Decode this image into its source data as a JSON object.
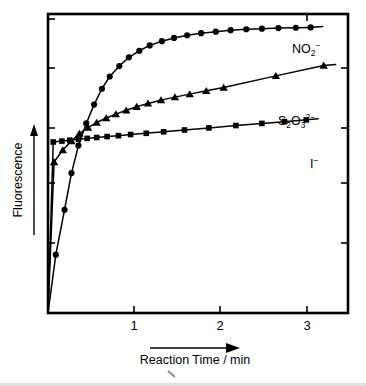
{
  "chart_data": {
    "type": "line",
    "title": "",
    "subtitle": "",
    "xlabel": "Reaction Time / min",
    "ylabel": "Fluorescence",
    "xlim": [
      0,
      3.45
    ],
    "ylim": [
      0,
      1.0
    ],
    "x_ticks": [
      1,
      2,
      3
    ],
    "x_tick_labels": [
      "1",
      "2",
      "3"
    ],
    "y_ticks": [],
    "y_tick_labels": [],
    "y_axis_unlabeled": true,
    "grid": false,
    "legend_position": "inline-right-of-curve",
    "frame": "box-with-inward-ticks",
    "series": [
      {
        "name": "NO2-",
        "label_text": "NO",
        "label_sub": "2",
        "label_sup": "−",
        "marker": "circle",
        "color": "#000000",
        "x": [
          0.0,
          0.09,
          0.19,
          0.27,
          0.35,
          0.44,
          0.53,
          0.62,
          0.71,
          0.82,
          0.93,
          1.05,
          1.17,
          1.31,
          1.45,
          1.6,
          1.76,
          1.93,
          2.1,
          2.28,
          2.46,
          2.65,
          2.85,
          3.02
        ],
        "y": [
          0.0,
          0.195,
          0.345,
          0.468,
          0.56,
          0.634,
          0.697,
          0.75,
          0.791,
          0.826,
          0.855,
          0.877,
          0.895,
          0.909,
          0.92,
          0.929,
          0.936,
          0.941,
          0.946,
          0.949,
          0.951,
          0.953,
          0.954,
          0.955
        ]
      },
      {
        "name": "S2O3 2-",
        "label_text": "S",
        "label_sub1": "2",
        "label_text2": "O",
        "label_sub2": "3",
        "label_sup": "2−",
        "marker": "triangle",
        "color": "#000000",
        "x": [
          0.0,
          0.07,
          0.17,
          0.27,
          0.36,
          0.46,
          0.56,
          0.67,
          0.78,
          0.9,
          1.02,
          1.15,
          1.3,
          1.46,
          1.63,
          1.82,
          2.02,
          2.62,
          3.17
        ],
        "y": [
          0.0,
          0.505,
          0.545,
          0.575,
          0.6,
          0.62,
          0.637,
          0.652,
          0.665,
          0.678,
          0.69,
          0.701,
          0.712,
          0.722,
          0.732,
          0.743,
          0.754,
          0.793,
          0.828
        ]
      },
      {
        "name": "I-",
        "label_text": "I",
        "label_sup": "−",
        "marker": "square",
        "color": "#000000",
        "x": [
          0.0,
          0.06,
          0.16,
          0.25,
          0.35,
          0.45,
          0.56,
          0.68,
          0.81,
          0.95,
          1.13,
          1.33,
          1.57,
          1.85,
          2.16,
          2.46,
          2.72,
          2.97
        ],
        "y": [
          0.0,
          0.572,
          0.575,
          0.578,
          0.581,
          0.584,
          0.587,
          0.59,
          0.593,
          0.597,
          0.601,
          0.606,
          0.612,
          0.619,
          0.627,
          0.634,
          0.64,
          0.646
        ]
      }
    ]
  },
  "axis": {
    "x_title": "Reaction Time / min",
    "y_title": "Fluorescence",
    "x_tick_1": "1",
    "x_tick_2": "2",
    "x_tick_3": "3"
  },
  "labels": {
    "no2_main": "NO",
    "no2_sub": "2",
    "no2_sup": "−",
    "s2o3_s": "S",
    "s2o3_sub_a": "2",
    "s2o3_o": "O",
    "s2o3_sub_b": "3",
    "s2o3_sup": "2−",
    "iodide_main": "I",
    "iodide_sup": "−"
  },
  "colors": {
    "ink": "#000000",
    "background": "#ffffff",
    "artifact": "#b9b9b9"
  }
}
